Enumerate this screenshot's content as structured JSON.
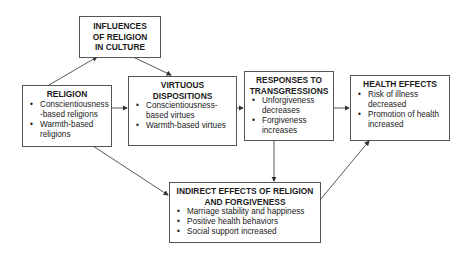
{
  "diagram": {
    "nodes": {
      "influences": {
        "title": "INFLUENCES OF RELIGION IN CULTURE",
        "title_lines": [
          "INFLUENCES",
          "OF RELIGION",
          "IN CULTURE"
        ],
        "items": []
      },
      "religion": {
        "title": "RELIGION",
        "items": [
          "Conscientiousness -based religions",
          "Warmth-based religions"
        ]
      },
      "virtuous": {
        "title_lines": [
          "VIRTUOUS",
          "DISPOSITIONS"
        ],
        "items": [
          "Conscientiousness-based virtues",
          "Warmth-based virtues"
        ]
      },
      "responses": {
        "title_lines": [
          "RESPONSES TO",
          "TRANSGRESSIONS"
        ],
        "items": [
          "Unforgiveness decreases",
          "Forgiveness increases"
        ]
      },
      "health": {
        "title": "HEALTH EFFECTS",
        "items": [
          "Risk of illness decreased",
          "Promotion of health increased"
        ]
      },
      "indirect": {
        "title_lines": [
          "INDIRECT EFFECTS OF RELIGION",
          "AND FORGIVENESS"
        ],
        "items": [
          "Marriage stability and happiness",
          "Positive health behaviors",
          "Social support increased"
        ]
      }
    },
    "edges": [
      {
        "from": "religion",
        "to": "influences"
      },
      {
        "from": "influences",
        "to": "virtuous"
      },
      {
        "from": "religion",
        "to": "virtuous"
      },
      {
        "from": "virtuous",
        "to": "responses"
      },
      {
        "from": "responses",
        "to": "health"
      },
      {
        "from": "religion",
        "to": "indirect"
      },
      {
        "from": "responses",
        "to": "indirect"
      },
      {
        "from": "indirect",
        "to": "health"
      }
    ]
  }
}
